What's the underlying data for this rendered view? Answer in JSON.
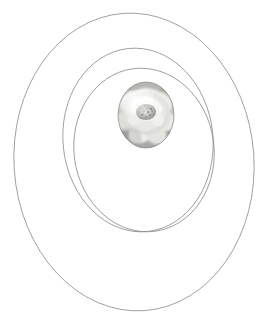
{
  "figure": {
    "background_color": "#ffffff",
    "width": 274,
    "height": 332,
    "caption": "Three concentric thin-line ellipse outlines enclosing an oval grayscale photograph of a white camellia flower"
  },
  "rings": [
    {
      "name": "outer-ellipse",
      "cx": 134,
      "cy": 162,
      "rx": 120,
      "ry": 149,
      "rotation": -4,
      "stroke_color": "#8c8c8c",
      "stroke_width": 0.8
    },
    {
      "name": "middle-ellipse",
      "cx": 138,
      "cy": 140,
      "rx": 75,
      "ry": 92,
      "rotation": -6,
      "stroke_color": "#8c8c8c",
      "stroke_width": 0.8
    },
    {
      "name": "inner-ellipse",
      "cx": 144,
      "cy": 150,
      "rx": 70,
      "ry": 82,
      "rotation": -8,
      "stroke_color": "#8c8c8c",
      "stroke_width": 0.8
    }
  ],
  "photo": {
    "name": "flower-photo",
    "subject": "white camellia flower",
    "shape": "oval",
    "cx": 146,
    "cy": 115,
    "rx": 28,
    "ry": 33,
    "rotation": 0,
    "border_color": "#7a7a7a",
    "border_width": 0.6,
    "palette": {
      "petal_highlight": "#f4f4f2",
      "petal_light": "#e3e3e0",
      "petal_mid": "#cfcfcb",
      "petal_shadow": "#b2b2ae",
      "background_gray": "#a7a7a4",
      "center_stamen": "#9a9a95",
      "center_dark": "#828280"
    }
  }
}
